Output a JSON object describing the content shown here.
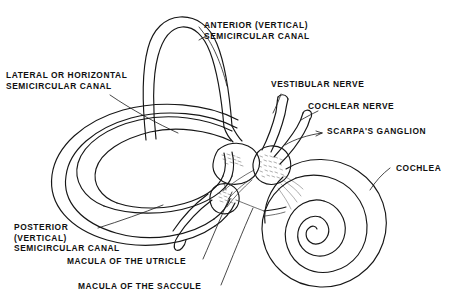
{
  "figure": {
    "kind": "anatomical-line-drawing",
    "width": 452,
    "height": 301,
    "background_color": "#ffffff",
    "ink_color": "#161616"
  },
  "labels": {
    "anterior_canal": {
      "line1": "ANTERIOR (VERTICAL)",
      "line2": "SEMICIRCULAR CANAL"
    },
    "lateral_canal": {
      "line1": "LATERAL OR HORIZONTAL",
      "line2": "SEMICIRCULAR CANAL"
    },
    "posterior_canal": {
      "line1": "POSTERIOR",
      "line2": "(VERTICAL)",
      "line3": "SEMICIRCULAR CANAL"
    },
    "vestibular_nerve": "VESTIBULAR NERVE",
    "cochlear_nerve": "COCHLEAR NERVE",
    "scarpas_ganglion": "SCARPA'S GANGLION",
    "cochlea": "COCHLEA",
    "macula_utricle": "MACULA OF THE UTRICLE",
    "macula_saccule": "MACULA OF THE SACCULE"
  }
}
